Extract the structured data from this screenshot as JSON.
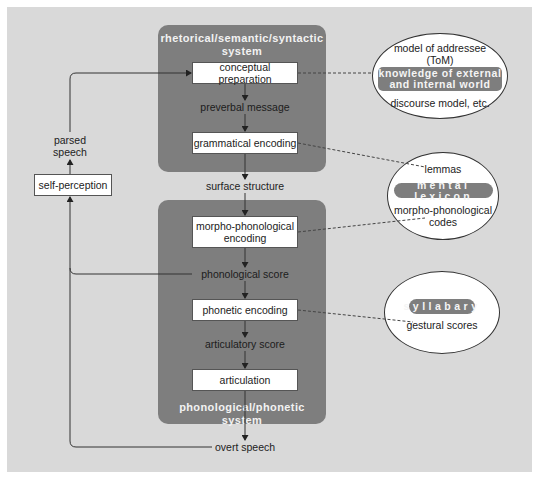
{
  "upper_system": {
    "title_line1": "rhetorical/semantic/syntactic",
    "title_line2": "system",
    "boxes": [
      {
        "label": "conceptual preparation"
      },
      {
        "label": "grammatical encoding"
      }
    ],
    "labels": {
      "preverbal_message": "preverbal message"
    }
  },
  "between": {
    "surface_structure": "surface structure"
  },
  "lower_system": {
    "title": "phonological/phonetic system",
    "boxes": [
      {
        "label_line1": "morpho-phonological",
        "label_line2": "encoding"
      },
      {
        "label": "phonetic encoding"
      },
      {
        "label": "articulation"
      }
    ],
    "labels": {
      "phonological_score": "phonological score",
      "articulatory_score": "articulatory score"
    }
  },
  "output": {
    "overt_speech": "overt speech"
  },
  "feedback": {
    "self_perception": "self-perception",
    "parsed_speech_line1": "parsed",
    "parsed_speech_line2": "speech"
  },
  "knowledge_ellipse": {
    "top_line1": "model of addressee",
    "top_line2": "(ToM)",
    "pill_line1": "knowledge of external",
    "pill_line2": "and internal world",
    "bottom": "discourse model, etc."
  },
  "lexicon_ellipse": {
    "top": "lemmas",
    "pill": "mental lexicon",
    "bottom_line1": "morpho-phonological",
    "bottom_line2": "codes"
  },
  "syllabary_ellipse": {
    "pill": "syllabary",
    "bottom": "gestural scores"
  },
  "colors": {
    "background": "#d9d9d9",
    "panel": "#7e7e7e",
    "box": "#ffffff",
    "line": "#333333"
  }
}
